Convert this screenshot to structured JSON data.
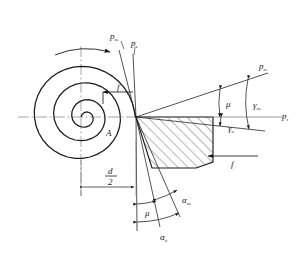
{
  "figure": {
    "type": "engineering-diagram",
    "stroke_color": "#1a1a1a",
    "centerline_color": "#777777",
    "hatch_color": "#2a2a2a",
    "background": "#ffffff"
  },
  "labels": {
    "p_se": {
      "base": "p",
      "sub": "se"
    },
    "p_s": {
      "base": "p",
      "sub": "s"
    },
    "p_re": {
      "base": "p",
      "sub": "re"
    },
    "p_r": {
      "base": "p",
      "sub": "r"
    },
    "gamma_o": {
      "base": "γ",
      "sub": "o"
    },
    "gamma_oe": {
      "base": "γ",
      "sub": "oe"
    },
    "alpha_o": {
      "base": "α",
      "sub": "o"
    },
    "alpha_oe": {
      "base": "α",
      "sub": "oe"
    },
    "mu_top": {
      "base": "μ",
      "sub": ""
    },
    "mu_bottom": {
      "base": "μ",
      "sub": ""
    },
    "feed_left": {
      "base": "f",
      "sub": ""
    },
    "feed_right": {
      "base": "f",
      "sub": ""
    },
    "point_A": {
      "base": "A",
      "sub": ""
    },
    "diameter_num": "d",
    "diameter_den": "2"
  },
  "annotations": {
    "rotation_arrow": "workpiece-rotation-direction",
    "feed_arrow_left": "feed-direction-inner",
    "feed_arrow_right": "feed-direction-outer",
    "dimension_radius": "half-diameter-dimension"
  },
  "geometry": {
    "spiral_center": {
      "x": 81,
      "y": 117
    },
    "tool_apex": {
      "x": 136,
      "y": 117
    },
    "spiral_turns": 2.1,
    "spiral_max_radius": 56
  }
}
